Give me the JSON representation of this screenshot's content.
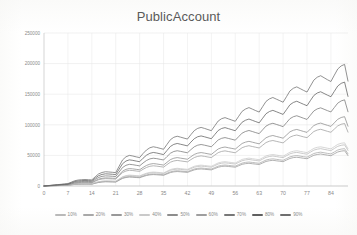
{
  "chart_data": {
    "type": "line",
    "title": "PublicAccount",
    "xlabel": "",
    "ylabel": "",
    "grid": true,
    "legend_position": "bottom",
    "xlim": [
      0,
      89
    ],
    "ylim": [
      0,
      250000
    ],
    "ytick_labels": [
      "0",
      "50000",
      "100000",
      "150000",
      "200000",
      "250000"
    ],
    "ytick_values": [
      0,
      50000,
      100000,
      150000,
      200000,
      250000
    ],
    "xtick_labels": [
      "0",
      "7",
      "14",
      "21",
      "28",
      "35",
      "42",
      "49",
      "56",
      "63",
      "70",
      "77",
      "84"
    ],
    "xtick_values": [
      0,
      7,
      14,
      21,
      28,
      35,
      42,
      49,
      56,
      63,
      70,
      77,
      84
    ],
    "x": [
      0,
      1,
      2,
      3,
      4,
      5,
      6,
      7,
      8,
      9,
      10,
      11,
      12,
      13,
      14,
      15,
      16,
      17,
      18,
      19,
      20,
      21,
      22,
      23,
      24,
      25,
      26,
      27,
      28,
      29,
      30,
      31,
      32,
      33,
      34,
      35,
      36,
      37,
      38,
      39,
      40,
      41,
      42,
      43,
      44,
      45,
      46,
      47,
      48,
      49,
      50,
      51,
      52,
      53,
      54,
      55,
      56,
      57,
      58,
      59,
      60,
      61,
      62,
      63,
      64,
      65,
      66,
      67,
      68,
      69,
      70,
      71,
      72,
      73,
      74,
      75,
      76,
      77,
      78,
      79,
      80,
      81,
      82,
      83,
      84,
      85,
      86,
      87,
      88,
      89
    ],
    "series": [
      {
        "name": "10%",
        "color": "#b9b9b9",
        "values": [
          0,
          200,
          400,
          600,
          800,
          1000,
          1200,
          1400,
          2200,
          3000,
          3400,
          3600,
          3700,
          3600,
          3500,
          5200,
          6800,
          7600,
          8000,
          7900,
          7700,
          7500,
          11000,
          14500,
          16200,
          17000,
          16700,
          16200,
          15800,
          18000,
          20000,
          21200,
          21800,
          21400,
          20900,
          20400,
          23000,
          25600,
          27000,
          27600,
          27100,
          26500,
          26000,
          28400,
          30700,
          31900,
          32500,
          31900,
          31300,
          30700,
          33300,
          35900,
          37200,
          37800,
          37200,
          36500,
          35900,
          38600,
          41300,
          42600,
          43300,
          42500,
          41700,
          41000,
          43900,
          46800,
          48200,
          49000,
          48100,
          47200,
          46400,
          49500,
          52600,
          54100,
          54900,
          53900,
          52900,
          52000,
          55300,
          58600,
          60200,
          61000,
          59900,
          58800,
          57800,
          61300,
          64800,
          66500,
          67300,
          58000
        ]
      },
      {
        "name": "20%",
        "color": "#a8a8a8",
        "values": [
          0,
          180,
          360,
          540,
          720,
          900,
          1080,
          1260,
          2000,
          2700,
          3060,
          3240,
          3330,
          3240,
          3150,
          4700,
          6150,
          6880,
          7240,
          7150,
          6970,
          6790,
          9950,
          13100,
          14670,
          15390,
          15110,
          14670,
          14300,
          16300,
          18100,
          19200,
          19700,
          19350,
          18900,
          18450,
          20800,
          23150,
          24400,
          24950,
          24500,
          23950,
          23500,
          25700,
          27800,
          28900,
          29400,
          28850,
          28300,
          27750,
          30100,
          32500,
          33700,
          34250,
          33700,
          33050,
          32500,
          34950,
          37400,
          38600,
          39200,
          38500,
          37800,
          37100,
          39750,
          42400,
          43700,
          44400,
          43600,
          42800,
          42000,
          44800,
          47600,
          49000,
          49700,
          48800,
          47900,
          47100,
          50100,
          53100,
          54500,
          55300,
          54300,
          53300,
          52400,
          55600,
          58800,
          60300,
          61000,
          52600
        ]
      },
      {
        "name": "30%",
        "color": "#989898",
        "values": [
          0,
          170,
          340,
          510,
          680,
          850,
          1020,
          1190,
          1880,
          2550,
          2890,
          3060,
          3150,
          3060,
          2970,
          4450,
          5800,
          6500,
          6840,
          6750,
          6580,
          6410,
          9400,
          12400,
          13880,
          14570,
          14300,
          13880,
          13530,
          15420,
          17100,
          18150,
          18640,
          18310,
          17870,
          17440,
          19700,
          21900,
          23100,
          23600,
          23200,
          22700,
          22200,
          24300,
          26300,
          27400,
          27800,
          27300,
          26800,
          26300,
          28500,
          30700,
          31900,
          32400,
          31900,
          31300,
          30700,
          33100,
          35400,
          36500,
          37100,
          36400,
          35700,
          35100,
          37600,
          40100,
          41300,
          42000,
          41200,
          40500,
          39700,
          42400,
          45000,
          46400,
          47000,
          46200,
          45300,
          44500,
          47400,
          50200,
          51500,
          52300,
          51300,
          50400,
          49500,
          52600,
          55600,
          57000,
          57700,
          49700
        ]
      },
      {
        "name": "40%",
        "color": "#c9c9c9",
        "values": [
          0,
          210,
          420,
          630,
          840,
          1050,
          1260,
          1470,
          2300,
          3130,
          3550,
          3760,
          3870,
          3760,
          3650,
          5450,
          7100,
          7960,
          8380,
          8270,
          8060,
          7850,
          11500,
          15200,
          17000,
          17850,
          17500,
          17000,
          16570,
          18900,
          20950,
          22250,
          22850,
          22450,
          21900,
          21350,
          24150,
          26900,
          28300,
          28950,
          28400,
          27800,
          27250,
          29800,
          32200,
          33500,
          34100,
          33500,
          32800,
          32200,
          35000,
          37700,
          39100,
          39700,
          39000,
          38300,
          37600,
          40500,
          43400,
          44700,
          45500,
          44600,
          43800,
          43000,
          46100,
          49100,
          50600,
          51400,
          50500,
          49600,
          48700,
          51900,
          55200,
          56800,
          57600,
          56600,
          55500,
          54600,
          58000,
          61500,
          63200,
          64000,
          62900,
          61700,
          60700,
          64300,
          68000,
          69800,
          70600,
          60900
        ]
      },
      {
        "name": "50%",
        "color": "#8c8c8c",
        "values": [
          0,
          320,
          640,
          960,
          1280,
          1600,
          1920,
          2240,
          3600,
          4900,
          5550,
          5880,
          6050,
          5880,
          5700,
          8600,
          11300,
          12600,
          13300,
          13100,
          12800,
          12500,
          18400,
          24300,
          27200,
          28500,
          28000,
          27200,
          26500,
          30300,
          33600,
          35700,
          36600,
          36000,
          35100,
          34200,
          38700,
          43100,
          45400,
          46400,
          45500,
          44600,
          43700,
          47800,
          51600,
          53700,
          54600,
          53700,
          52600,
          51600,
          56100,
          60500,
          62700,
          63700,
          62500,
          61400,
          60300,
          64900,
          69500,
          71700,
          73000,
          71600,
          70200,
          68900,
          73900,
          78800,
          81200,
          82500,
          81000,
          79600,
          78100,
          83300,
          88500,
          91100,
          92400,
          90800,
          89100,
          87600,
          93200,
          98700,
          101400,
          102800,
          100900,
          99100,
          97400,
          103200,
          109000,
          111900,
          113300,
          97700
        ]
      },
      {
        "name": "60%",
        "color": "#9e9e9e",
        "values": [
          0,
          290,
          580,
          870,
          1160,
          1450,
          1740,
          2030,
          3240,
          4420,
          5010,
          5300,
          5460,
          5300,
          5140,
          7760,
          10200,
          11400,
          12000,
          11800,
          11550,
          11280,
          16600,
          21900,
          24500,
          25700,
          25250,
          24500,
          23900,
          27300,
          30300,
          32200,
          33000,
          32450,
          31700,
          30850,
          34900,
          38900,
          40900,
          41800,
          41000,
          40200,
          39400,
          43100,
          46500,
          48400,
          49200,
          48400,
          47400,
          46500,
          50500,
          54500,
          56500,
          57400,
          56300,
          55300,
          54300,
          58500,
          62600,
          64600,
          65800,
          64500,
          63300,
          62100,
          66600,
          71000,
          73200,
          74300,
          73000,
          71700,
          70400,
          75100,
          79800,
          82100,
          83300,
          81800,
          80300,
          79000,
          84000,
          89000,
          91400,
          92700,
          91000,
          89300,
          87800,
          93000,
          98200,
          100900,
          102100,
          88000
        ]
      },
      {
        "name": "70%",
        "color": "#777777",
        "values": [
          0,
          400,
          800,
          1200,
          1600,
          2000,
          2400,
          2800,
          4500,
          6100,
          6900,
          7300,
          7500,
          7300,
          7100,
          10700,
          14000,
          15700,
          16500,
          16300,
          15900,
          15500,
          22900,
          30200,
          33800,
          35400,
          34800,
          33800,
          32900,
          37600,
          41700,
          44300,
          45400,
          44700,
          43600,
          42500,
          48100,
          53500,
          56400,
          57600,
          56600,
          55400,
          54300,
          59400,
          64100,
          66700,
          67800,
          66700,
          65400,
          64100,
          69700,
          75200,
          77900,
          79100,
          77700,
          76300,
          74900,
          80700,
          86400,
          89100,
          90700,
          89000,
          87200,
          85600,
          91800,
          97900,
          100900,
          102500,
          100700,
          98900,
          97000,
          103500,
          110000,
          113200,
          114800,
          112800,
          110700,
          108800,
          115800,
          122600,
          126000,
          127700,
          125400,
          123100,
          121000,
          128200,
          135400,
          139000,
          140800,
          121300
        ]
      },
      {
        "name": "80%",
        "color": "#5f5f5f",
        "values": [
          0,
          480,
          960,
          1440,
          1920,
          2400,
          2880,
          3360,
          5400,
          7350,
          8330,
          8820,
          9060,
          8820,
          8580,
          12900,
          16900,
          18900,
          19900,
          19600,
          19200,
          18700,
          27600,
          36400,
          40800,
          42700,
          41900,
          40700,
          39700,
          45400,
          50300,
          53400,
          54800,
          53900,
          52600,
          51300,
          58000,
          64600,
          68000,
          69500,
          68200,
          66900,
          65500,
          71700,
          77300,
          80500,
          81800,
          80400,
          78800,
          77300,
          84100,
          90700,
          94000,
          95400,
          93700,
          92000,
          90300,
          97300,
          104200,
          107500,
          109400,
          107300,
          105200,
          103200,
          110700,
          118100,
          121700,
          123600,
          121400,
          119200,
          117000,
          124800,
          132700,
          136500,
          138500,
          136000,
          133500,
          131200,
          139700,
          147900,
          152000,
          154000,
          151200,
          148400,
          145900,
          154700,
          163400,
          167700,
          169800,
          146400
        ]
      },
      {
        "name": "90%",
        "color": "#6e6e6e",
        "values": [
          0,
          560,
          1120,
          1680,
          2240,
          2800,
          3360,
          3920,
          6300,
          8600,
          9750,
          10300,
          10600,
          10300,
          10000,
          15100,
          19800,
          22100,
          23300,
          22900,
          22400,
          21900,
          32300,
          42600,
          47700,
          50000,
          49000,
          47600,
          46400,
          53100,
          58800,
          62500,
          64100,
          63000,
          61500,
          60000,
          67900,
          75600,
          79600,
          81300,
          79800,
          78200,
          76700,
          83900,
          90500,
          94200,
          95700,
          94100,
          92200,
          90400,
          98400,
          106200,
          110000,
          111700,
          109700,
          107700,
          105700,
          113900,
          122000,
          125800,
          128100,
          125600,
          123100,
          120800,
          129600,
          138200,
          142400,
          144600,
          142000,
          139500,
          136900,
          146000,
          155300,
          159700,
          162000,
          159100,
          156200,
          153500,
          163400,
          173000,
          177800,
          180200,
          176900,
          173600,
          170700,
          181100,
          191200,
          196200,
          198700,
          171300
        ]
      }
    ]
  }
}
